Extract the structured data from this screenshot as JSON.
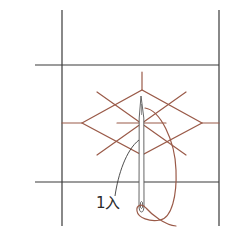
{
  "diagram": {
    "colors": {
      "grid": "#3a3a3a",
      "thread": "#9a5a48",
      "needle": "#555555",
      "background": "#ffffff"
    },
    "labels": {
      "step": "1入"
    },
    "grid_lines": {
      "left_vertical": {
        "x": 62,
        "y1": 10,
        "y2": 226
      },
      "right_vertical": {
        "x": 219,
        "y1": 10,
        "y2": 226
      },
      "top_horizontal": {
        "y": 65,
        "x1": 35,
        "x2": 219
      },
      "bottom_horizontal": {
        "y": 182,
        "x1": 35,
        "x2": 219
      }
    },
    "stitch_pattern": {
      "center": [
        142,
        123
      ],
      "diamond": {
        "left": [
          82,
          123
        ],
        "top": [
          142,
          90
        ],
        "right": [
          202,
          123
        ],
        "bottom": [
          142,
          155
        ]
      }
    }
  }
}
